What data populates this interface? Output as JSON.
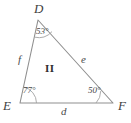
{
  "figure": {
    "type": "triangle-diagram",
    "region_label": "II",
    "stroke_color": "#8f8f8f",
    "text_color": "#4a4a4a",
    "background_color": "#ffffff",
    "vertices": [
      {
        "name": "D",
        "label": "D",
        "x": 38,
        "y": 20
      },
      {
        "name": "E",
        "label": "E",
        "x": 20,
        "y": 103
      },
      {
        "name": "F",
        "label": "F",
        "x": 113,
        "y": 103
      }
    ],
    "angles": [
      {
        "at": "D",
        "label": "53°",
        "value": 53
      },
      {
        "at": "E",
        "label": "77°",
        "value": 77
      },
      {
        "at": "F",
        "label": "50°",
        "value": 50
      }
    ],
    "sides": [
      {
        "name": "f",
        "label": "f",
        "between": "D-E"
      },
      {
        "name": "e",
        "label": "e",
        "between": "D-F"
      },
      {
        "name": "d",
        "label": "d",
        "between": "E-F"
      }
    ]
  }
}
